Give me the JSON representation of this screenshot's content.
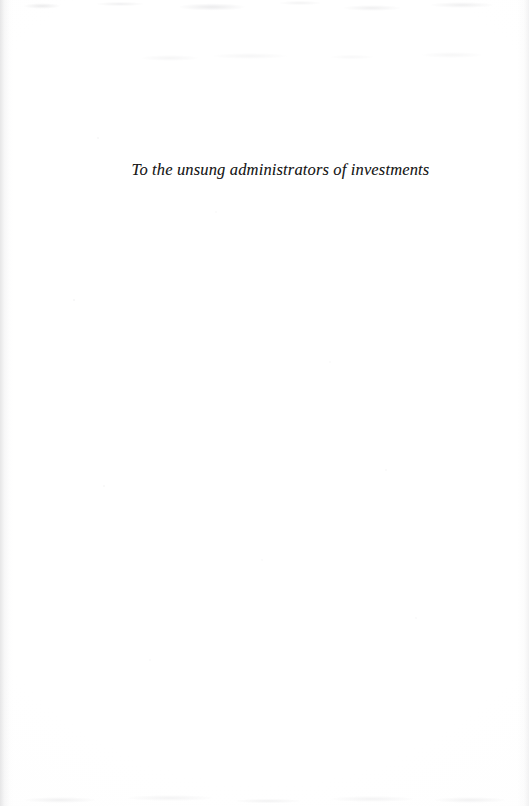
{
  "document": {
    "kind": "book-dedication-page",
    "page_background_color": "#fefefe",
    "ink_color": "#191919"
  },
  "dedication": {
    "text": "To the unsung administrators of investments"
  }
}
